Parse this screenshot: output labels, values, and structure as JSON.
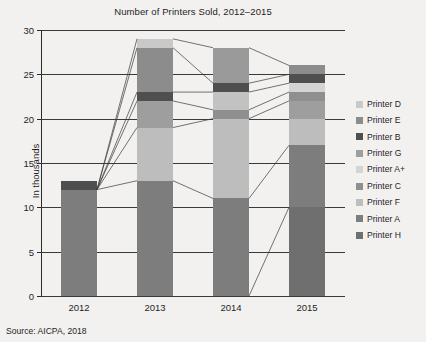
{
  "chart_data": {
    "type": "bar",
    "stacked": true,
    "title": "Number of Printers Sold, 2012–2015",
    "xlabel": "",
    "ylabel": "In thousands",
    "categories": [
      "2012",
      "2013",
      "2014",
      "2015"
    ],
    "ylim": [
      0,
      30
    ],
    "yticks": [
      0,
      5,
      10,
      15,
      20,
      25,
      30
    ],
    "grid": true,
    "legend_position": "right",
    "source": "Source: AICPA, 2018",
    "totals": [
      13,
      29,
      28,
      26
    ],
    "series": [
      {
        "name": "Printer D",
        "color": "#c9c9c9",
        "values": [
          0,
          1,
          0,
          1
        ]
      },
      {
        "name": "Printer E",
        "color": "#8c8c8c",
        "values": [
          0,
          5,
          4,
          1
        ]
      },
      {
        "name": "Printer B",
        "color": "#4f4f4f",
        "values": [
          1,
          1,
          1,
          1
        ]
      },
      {
        "name": "Printer G",
        "color": "#9e9e9e",
        "values": [
          0,
          3,
          2,
          1
        ]
      },
      {
        "name": "Printer A+",
        "color": "#d4d4d4",
        "values": [
          0,
          0,
          0,
          1
        ]
      },
      {
        "name": "Printer C",
        "color": "#8f8f8f",
        "values": [
          0,
          0,
          1,
          1
        ]
      },
      {
        "name": "Printer F",
        "color": "#bdbdbd",
        "values": [
          0,
          6,
          9,
          2
        ]
      },
      {
        "name": "Printer A",
        "color": "#7d7d7d",
        "values": [
          12,
          13,
          11,
          3
        ]
      },
      {
        "name": "Printer H",
        "color": "#6f6f6f",
        "values": [
          0,
          0,
          0,
          15
        ]
      }
    ],
    "bars": [
      {
        "year": "2012",
        "total": 13,
        "segments": [
          {
            "series": "Printer A",
            "from": 0,
            "to": 12,
            "color": "#7d7d7d"
          },
          {
            "series": "Printer B",
            "from": 12,
            "to": 13,
            "color": "#4f4f4f"
          }
        ]
      },
      {
        "year": "2013",
        "total": 29,
        "segments": [
          {
            "series": "Printer A",
            "from": 0,
            "to": 13,
            "color": "#7d7d7d"
          },
          {
            "series": "Printer F",
            "from": 13,
            "to": 19,
            "color": "#bdbdbd"
          },
          {
            "series": "Printer G",
            "from": 19,
            "to": 22,
            "color": "#9e9e9e"
          },
          {
            "series": "Printer B",
            "from": 22,
            "to": 23,
            "color": "#4f4f4f"
          },
          {
            "series": "Printer E",
            "from": 23,
            "to": 28,
            "color": "#8c8c8c"
          },
          {
            "series": "Printer D",
            "from": 28,
            "to": 29,
            "color": "#c9c9c9"
          }
        ]
      },
      {
        "year": "2014",
        "total": 28,
        "segments": [
          {
            "series": "Printer A",
            "from": 0,
            "to": 11,
            "color": "#7d7d7d"
          },
          {
            "series": "Printer F",
            "from": 11,
            "to": 20,
            "color": "#bdbdbd"
          },
          {
            "series": "Printer C",
            "from": 20,
            "to": 21,
            "color": "#8f8f8f"
          },
          {
            "series": "Printer G",
            "from": 21,
            "to": 23,
            "color": "#c2c2c2"
          },
          {
            "series": "Printer B",
            "from": 23,
            "to": 24,
            "color": "#4f4f4f"
          },
          {
            "series": "Printer E",
            "from": 24,
            "to": 28,
            "color": "#9a9a9a"
          }
        ]
      },
      {
        "year": "2015",
        "total": 26,
        "segments": [
          {
            "series": "Printer H",
            "from": 0,
            "to": 10,
            "color": "#6f6f6f"
          },
          {
            "series": "Printer A",
            "from": 10,
            "to": 17,
            "color": "#7d7d7d"
          },
          {
            "series": "Printer F",
            "from": 17,
            "to": 20,
            "color": "#bdbdbd"
          },
          {
            "series": "Printer G",
            "from": 20,
            "to": 22,
            "color": "#9e9e9e"
          },
          {
            "series": "Printer C",
            "from": 22,
            "to": 23,
            "color": "#8f8f8f"
          },
          {
            "series": "Printer A+",
            "from": 23,
            "to": 24,
            "color": "#d4d4d4"
          },
          {
            "series": "Printer B",
            "from": 24,
            "to": 25,
            "color": "#4f4f4f"
          },
          {
            "series": "Printer E",
            "from": 25,
            "to": 26,
            "color": "#8c8c8c"
          }
        ]
      }
    ],
    "connectors": [
      {
        "from_year": "2012",
        "from_value": 12,
        "to_year": "2013",
        "to_value": 29
      },
      {
        "from_year": "2012",
        "from_value": 12,
        "to_year": "2013",
        "to_value": 28
      },
      {
        "from_year": "2012",
        "from_value": 12,
        "to_year": "2013",
        "to_value": 23
      },
      {
        "from_year": "2012",
        "from_value": 12,
        "to_year": "2013",
        "to_value": 22
      },
      {
        "from_year": "2012",
        "from_value": 12,
        "to_year": "2013",
        "to_value": 19
      },
      {
        "from_year": "2012",
        "from_value": 12,
        "to_year": "2013",
        "to_value": 13
      },
      {
        "from_year": "2013",
        "from_value": 29,
        "to_year": "2014",
        "to_value": 28
      },
      {
        "from_year": "2013",
        "from_value": 28,
        "to_year": "2014",
        "to_value": 24
      },
      {
        "from_year": "2013",
        "from_value": 23,
        "to_year": "2014",
        "to_value": 23
      },
      {
        "from_year": "2013",
        "from_value": 22,
        "to_year": "2014",
        "to_value": 21
      },
      {
        "from_year": "2013",
        "from_value": 19,
        "to_year": "2014",
        "to_value": 20
      },
      {
        "from_year": "2013",
        "from_value": 13,
        "to_year": "2014",
        "to_value": 11
      },
      {
        "from_year": "2014",
        "from_value": 28,
        "to_year": "2015",
        "to_value": 26
      },
      {
        "from_year": "2014",
        "from_value": 24,
        "to_year": "2015",
        "to_value": 25
      },
      {
        "from_year": "2014",
        "from_value": 23,
        "to_year": "2015",
        "to_value": 24
      },
      {
        "from_year": "2014",
        "from_value": 21,
        "to_year": "2015",
        "to_value": 23
      },
      {
        "from_year": "2014",
        "from_value": 20,
        "to_year": "2015",
        "to_value": 22
      },
      {
        "from_year": "2014",
        "from_value": 11,
        "to_year": "2015",
        "to_value": 17
      },
      {
        "from_year": "2014",
        "from_value": 0,
        "to_year": "2015",
        "to_value": 10
      }
    ]
  }
}
